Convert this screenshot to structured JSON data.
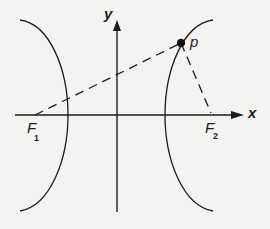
{
  "diagram": {
    "type": "hyperbola-foci",
    "background": "#f3f3f1",
    "stroke_color": "#1c1c1c",
    "axes": {
      "x_label": "x",
      "y_label": "y"
    },
    "point": {
      "label": "p"
    },
    "foci": [
      {
        "label": "F",
        "subscript": "1"
      },
      {
        "label": "F",
        "subscript": "2"
      }
    ],
    "elements": [
      "left hyperbola branch",
      "right hyperbola branch",
      "dashed segment F1 to p",
      "dashed segment p to F2"
    ]
  }
}
